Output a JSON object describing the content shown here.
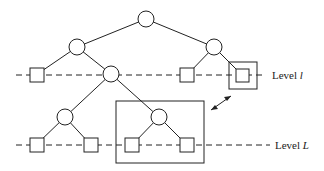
{
  "labels": {
    "level_l_prefix": "Level ",
    "level_l_var": "l",
    "level_L_prefix": "Level ",
    "level_L_var": "L"
  },
  "colors": {
    "stroke": "#222222",
    "background": "#ffffff"
  }
}
